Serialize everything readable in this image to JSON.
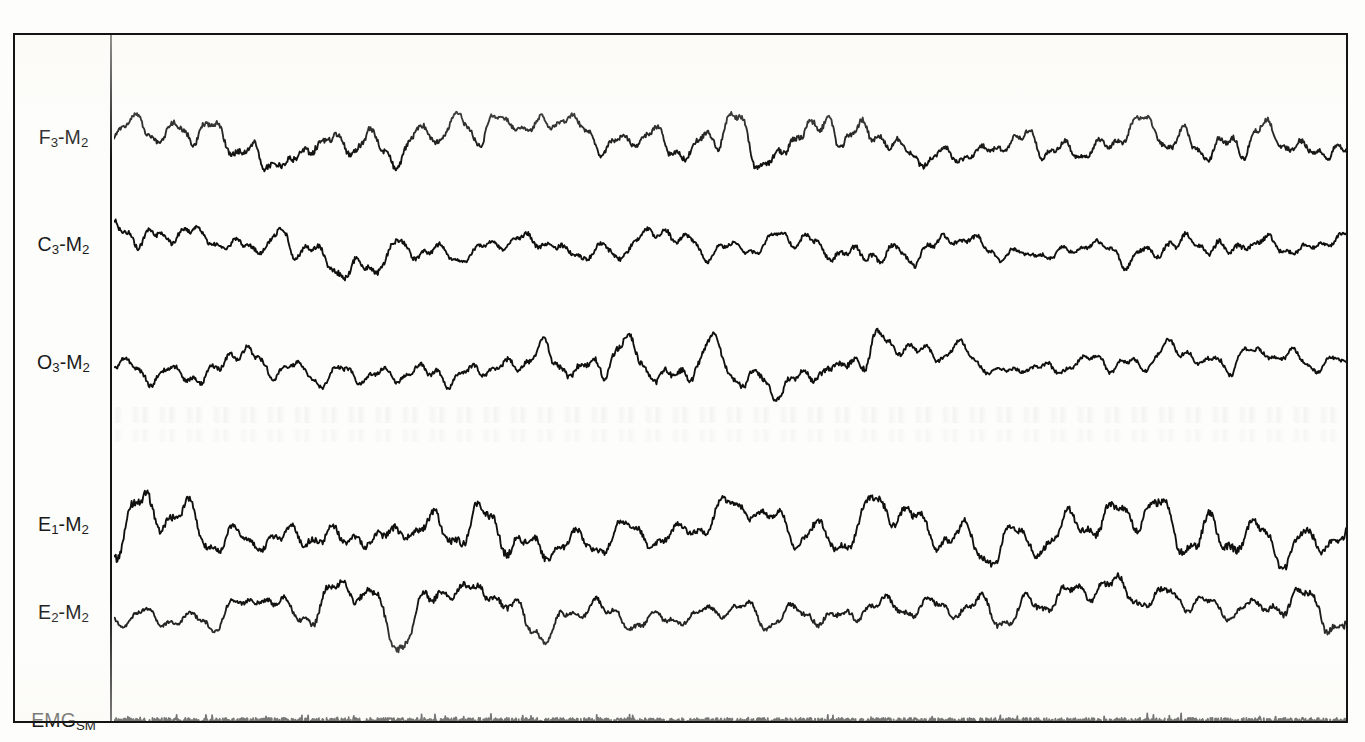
{
  "figure": {
    "kind": "polysomnogram",
    "background_color": "#fdfdfb",
    "trace_color": "#101010",
    "frame_color": "#141414"
  },
  "frame": {
    "left": 13,
    "top": 33,
    "width": 1335,
    "height": 690,
    "border_width": 2,
    "label_gutter_width": 97
  },
  "chart_data": {
    "type": "line",
    "title": "",
    "xlabel": "",
    "ylabel": "",
    "grid": false,
    "legend_position": "left-gutter",
    "x": [
      0,
      1
    ],
    "channels": [
      {
        "label_html": "F<sub>3</sub>-M<sub>2</sub>",
        "label_text": "F3-M2",
        "name": "frontal-eeg",
        "baseline_y": 105,
        "amplitude": 55,
        "seed": 11,
        "roughness": 0.42,
        "slow_hz": 2.35,
        "samples": 1500,
        "kind": "eeg"
      },
      {
        "label_html": "C<sub>3</sub>-M<sub>2</sub>",
        "label_text": "C3-M2",
        "name": "central-eeg",
        "baseline_y": 212,
        "amplitude": 52,
        "seed": 27,
        "roughness": 0.4,
        "slow_hz": 2.3,
        "samples": 1500,
        "kind": "eeg"
      },
      {
        "label_html": "O<sub>3</sub>-M<sub>2</sub>",
        "label_text": "O3-M2",
        "name": "occipital-eeg",
        "baseline_y": 330,
        "amplitude": 52,
        "seed": 43,
        "roughness": 0.4,
        "slow_hz": 2.28,
        "samples": 1500,
        "kind": "eeg"
      },
      {
        "label_html": "E<sub>1</sub>-M<sub>2</sub>",
        "label_text": "E1-M2",
        "name": "left-eog",
        "baseline_y": 492,
        "amplitude": 72,
        "seed": 61,
        "roughness": 0.33,
        "slow_hz": 1.95,
        "samples": 1400,
        "kind": "eog"
      },
      {
        "label_html": "E<sub>2</sub>-M<sub>2</sub>",
        "label_text": "E2-M2",
        "name": "right-eog",
        "baseline_y": 580,
        "amplitude": 62,
        "seed": 79,
        "roughness": 0.35,
        "slow_hz": 2.05,
        "samples": 1400,
        "kind": "eog"
      },
      {
        "label_html": "EMG<sub>SM</sub>",
        "label_text": "EMGSM",
        "name": "submental-emg",
        "baseline_y": 688,
        "amplitude": 3.2,
        "seed": 97,
        "roughness": 1.0,
        "slow_hz": 0,
        "samples": 2400,
        "kind": "emg"
      }
    ]
  }
}
